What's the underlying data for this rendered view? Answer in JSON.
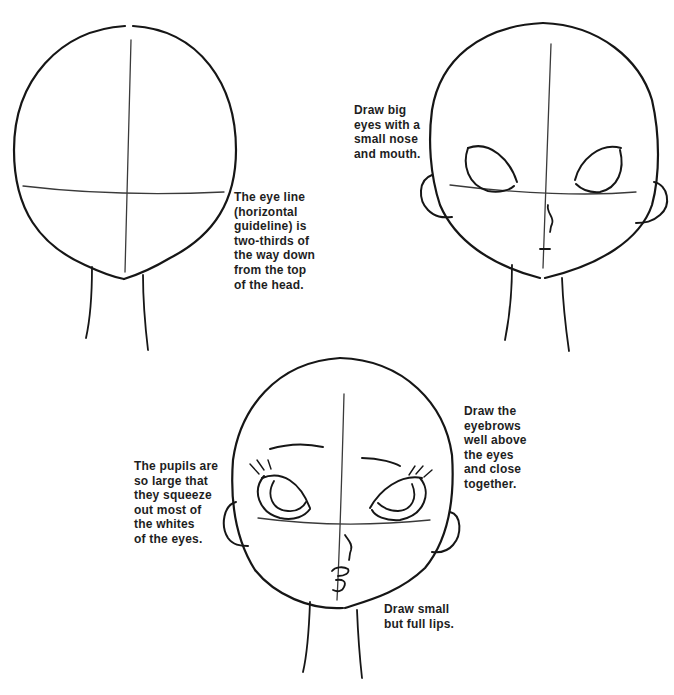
{
  "figures": [
    {
      "id": "head-base",
      "description": "Basic head shape with vertical and horizontal guidelines",
      "caption": "The eye line\n(horizontal\nguideline) is\ntwo-thirds of\nthe way down\nfrom the top\nof the head."
    },
    {
      "id": "head-features",
      "description": "Head with big eyes, small nose and mouth, ears",
      "caption": "Draw big\neyes with a\nsmall nose\nand mouth."
    },
    {
      "id": "head-detailed",
      "description": "Detailed head with pupils, eyebrows, lashes and lips",
      "captions": {
        "pupils": "The pupils are\nso large that\nthey squeeze\nout most of\nthe whites\nof the eyes.",
        "eyebrows": "Draw the\neyebrows\nwell above\nthe eyes\nand close\ntogether.",
        "lips": "Draw small\nbut full lips."
      }
    }
  ],
  "colors": {
    "background": "#ffffff",
    "ink": "#161616",
    "text": "#1e1e1e"
  }
}
